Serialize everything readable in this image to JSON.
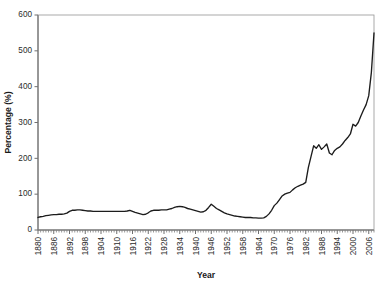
{
  "chart_data": {
    "type": "line",
    "title": "",
    "xlabel": "Year",
    "ylabel": "Percentage (%)",
    "xlim": [
      1880,
      2008
    ],
    "ylim": [
      0,
      600
    ],
    "ytick_step": 100,
    "xtick_step": 6,
    "grid": false,
    "legend": false,
    "yticks": [
      0,
      100,
      200,
      300,
      400,
      500,
      600
    ],
    "ytick_labels": [
      "0",
      "100",
      "200",
      "300",
      "400",
      "500",
      "600"
    ],
    "xticks": [
      1880,
      1886,
      1892,
      1898,
      1904,
      1910,
      1916,
      1922,
      1928,
      1934,
      1940,
      1946,
      1952,
      1958,
      1964,
      1970,
      1976,
      1982,
      1988,
      1994,
      2000,
      2006
    ],
    "xtick_labels": [
      "1880",
      "1886",
      "1892",
      "1898",
      "1904",
      "1910",
      "1916",
      "1922",
      "1928",
      "1934",
      "1940",
      "1946",
      "1952",
      "1958",
      "1964",
      "1970",
      "1976",
      "1982",
      "1988",
      "1994",
      "2000",
      "2006"
    ],
    "line_color": "#1c1c1c",
    "series": [
      {
        "name": "Percentage",
        "x": [
          1880,
          1881,
          1882,
          1883,
          1884,
          1885,
          1886,
          1887,
          1888,
          1889,
          1890,
          1891,
          1892,
          1893,
          1894,
          1895,
          1896,
          1897,
          1898,
          1899,
          1900,
          1901,
          1902,
          1903,
          1904,
          1905,
          1906,
          1907,
          1908,
          1909,
          1910,
          1911,
          1912,
          1913,
          1914,
          1915,
          1916,
          1917,
          1918,
          1919,
          1920,
          1921,
          1922,
          1923,
          1924,
          1925,
          1926,
          1927,
          1928,
          1929,
          1930,
          1931,
          1932,
          1933,
          1934,
          1935,
          1936,
          1937,
          1938,
          1939,
          1940,
          1941,
          1942,
          1943,
          1944,
          1945,
          1946,
          1947,
          1948,
          1949,
          1950,
          1951,
          1952,
          1953,
          1954,
          1955,
          1956,
          1957,
          1958,
          1959,
          1960,
          1961,
          1962,
          1963,
          1964,
          1965,
          1966,
          1967,
          1968,
          1969,
          1970,
          1971,
          1972,
          1973,
          1974,
          1975,
          1976,
          1977,
          1978,
          1979,
          1980,
          1981,
          1982,
          1983,
          1984,
          1985,
          1986,
          1987,
          1988,
          1989,
          1990,
          1991,
          1992,
          1993,
          1994,
          1995,
          1996,
          1997,
          1998,
          1999,
          2000,
          2001,
          2002,
          2003,
          2004,
          2005,
          2006,
          2007,
          2008
        ],
        "values": [
          35,
          37,
          38,
          40,
          41,
          42,
          43,
          43,
          44,
          44,
          45,
          47,
          52,
          55,
          55,
          56,
          56,
          55,
          54,
          53,
          53,
          52,
          52,
          52,
          52,
          52,
          52,
          52,
          52,
          52,
          52,
          52,
          52,
          52,
          53,
          55,
          52,
          49,
          47,
          45,
          43,
          44,
          48,
          53,
          55,
          55,
          55,
          56,
          56,
          56,
          58,
          60,
          63,
          65,
          66,
          65,
          63,
          60,
          58,
          56,
          54,
          52,
          50,
          51,
          55,
          63,
          72,
          66,
          60,
          56,
          52,
          48,
          45,
          43,
          41,
          39,
          38,
          37,
          36,
          35,
          35,
          35,
          34,
          34,
          33,
          33,
          34,
          38,
          45,
          55,
          68,
          75,
          85,
          95,
          100,
          103,
          105,
          112,
          118,
          122,
          125,
          128,
          133,
          175,
          205,
          235,
          228,
          238,
          225,
          232,
          240,
          215,
          210,
          222,
          228,
          232,
          240,
          250,
          258,
          268,
          295,
          290,
          300,
          318,
          335,
          350,
          375,
          440,
          550
        ]
      }
    ]
  }
}
